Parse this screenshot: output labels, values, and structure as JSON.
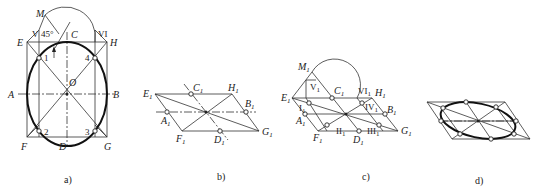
{
  "figure": {
    "panels": [
      {
        "id": "a",
        "caption": "a)",
        "labels": {
          "M": "M",
          "V": "V",
          "angle": "45°",
          "C": "C",
          "VI": "VI",
          "E": "E",
          "H": "H",
          "p1": "1",
          "p4": "4",
          "O": "O",
          "A": "A",
          "B": "B",
          "p2": "2",
          "p3": "3",
          "F": "F",
          "D": "D",
          "G": "G"
        }
      },
      {
        "id": "b",
        "caption": "b)",
        "labels": {
          "E": "E",
          "C": "C",
          "H": "H",
          "B": "B",
          "A": "A",
          "F": "F",
          "D": "D",
          "G": "G",
          "sub": "1"
        }
      },
      {
        "id": "c",
        "caption": "c)",
        "labels": {
          "M": "M",
          "V": "V",
          "C": "C",
          "VI": "VI",
          "H": "H",
          "E": "E",
          "I": "I",
          "IV": "IV",
          "B": "B",
          "A": "A",
          "F": "F",
          "II": "II",
          "D": "D",
          "III": "III",
          "G": "G",
          "sub": "1"
        }
      },
      {
        "id": "d",
        "caption": "d)"
      }
    ]
  }
}
